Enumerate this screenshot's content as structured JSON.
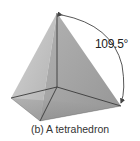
{
  "figure": {
    "shape": "tetrahedron",
    "angle_label": "109.5°",
    "caption": "(b) A tetrahedron",
    "colors": {
      "face_light": "#c8c8c8",
      "face_mid": "#a8a8a8",
      "face_dark": "#8e8e8e",
      "edge": "#3a3a3a",
      "arrow": "#444444"
    }
  }
}
